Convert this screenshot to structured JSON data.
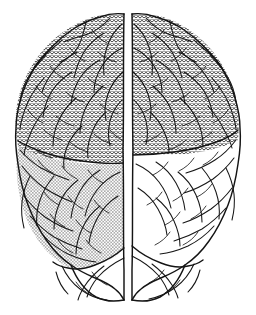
{
  "figure": {
    "title": "Human brain, superior (dorsal) view",
    "subject": "brain",
    "view": "superior",
    "style": "black-and-white line drawing with hatched shading",
    "background_color": "#ffffff",
    "line_color": "#141414",
    "width_px": 256,
    "height_px": 315,
    "caption": ""
  },
  "regions": [
    {
      "id": "left-frontal",
      "label": "Left frontal region",
      "hemisphere": "left",
      "shading": "zigzag-and-dot",
      "pattern_id": "zigzagDot",
      "fill_color": "#1a1a1a",
      "shaded": true
    },
    {
      "id": "right-frontal",
      "label": "Right frontal region",
      "hemisphere": "right",
      "shading": "zigzag-and-dot",
      "pattern_id": "zigzagDot",
      "fill_color": "#1a1a1a",
      "shaded": true
    },
    {
      "id": "left-parietal",
      "label": "Left parietal region",
      "hemisphere": "left",
      "shading": "stipple-dots",
      "pattern_id": "stippleDot",
      "fill_color": "#1a1a1a",
      "shaded": true
    },
    {
      "id": "right-parietal",
      "label": "Right parietal region",
      "hemisphere": "right",
      "shading": "none",
      "pattern_id": "",
      "fill_color": "#ffffff",
      "shaded": false
    },
    {
      "id": "left-occipital",
      "label": "Left occipital region",
      "hemisphere": "left",
      "shading": "none",
      "pattern_id": "",
      "fill_color": "#ffffff",
      "shaded": false
    },
    {
      "id": "right-occipital",
      "label": "Right occipital region",
      "hemisphere": "right",
      "shading": "none",
      "pattern_id": "",
      "fill_color": "#ffffff",
      "shaded": false
    }
  ],
  "features": [
    {
      "id": "longitudinal-fissure",
      "label": "Longitudinal fissure",
      "orientation": "vertical-midline"
    },
    {
      "id": "central-sulcus-left",
      "label": "Left central sulcus",
      "orientation": "oblique"
    },
    {
      "id": "central-sulcus-right",
      "label": "Right central sulcus",
      "orientation": "oblique"
    }
  ],
  "legend": {
    "visible": false,
    "entries": []
  },
  "annotations": [],
  "labels": []
}
